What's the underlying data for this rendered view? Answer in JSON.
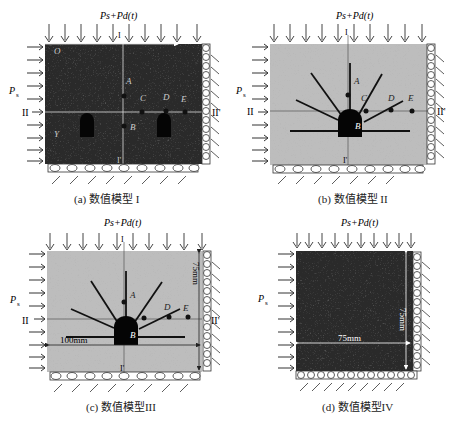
{
  "figure": {
    "panels": [
      {
        "id": "a",
        "caption": "(a) 数值模型 I",
        "top_load": "Ps+Pd(t)",
        "side_load": "Ps",
        "section_vertical": [
          "I",
          "I'"
        ],
        "section_horizontal": [
          "II",
          "II'"
        ],
        "points": [
          "A",
          "B",
          "C",
          "D",
          "E"
        ],
        "corner_labels": [
          "O",
          "Y"
        ],
        "fill": "dark-speckle"
      },
      {
        "id": "b",
        "caption": "(b) 数值模型 II",
        "top_load": "Ps+Pd(t)",
        "side_load": "Ps",
        "section_vertical": [
          "I",
          "I'"
        ],
        "section_horizontal": [
          "II",
          "II'"
        ],
        "points": [
          "A",
          "B",
          "C",
          "D",
          "E"
        ],
        "fill": "light-speckle"
      },
      {
        "id": "c",
        "caption": "(c) 数值模型III",
        "top_load": "Ps+Pd(t)",
        "side_load": "Ps",
        "section_vertical": [
          "I",
          "I'"
        ],
        "section_horizontal": [
          "II",
          "II'"
        ],
        "points": [
          "A",
          "B",
          "D",
          "E"
        ],
        "dim_width": "100mm",
        "dim_height": "75mm",
        "fill": "light-speckle"
      },
      {
        "id": "d",
        "caption": "(d) 数值模型IV",
        "top_load": "Ps+Pd(t)",
        "side_load": "Ps",
        "dim_width": "75mm",
        "dim_height": "75mm",
        "fill": "dark-speckle"
      }
    ],
    "colors": {
      "dark_fill": "#2a2a2a",
      "light_fill": "#bdbdbd",
      "crack": "#111111",
      "roller": "#ffffff",
      "line": "#333333"
    }
  }
}
